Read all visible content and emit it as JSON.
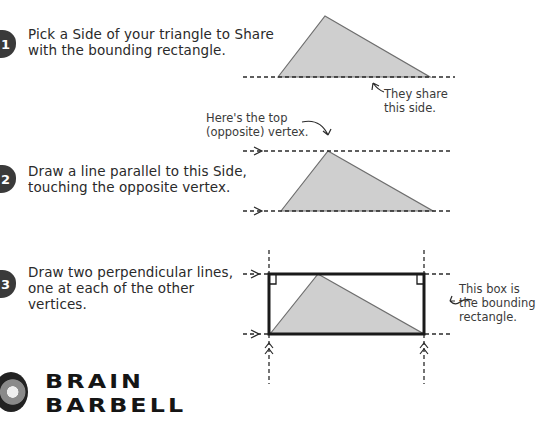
{
  "steps": [
    {
      "number": "1",
      "line1": "Pick a Side of your triangle to Share",
      "line2": "with the bounding rectangle.",
      "line3": ""
    },
    {
      "number": "2",
      "line1": "Draw a line parallel to this Side,",
      "line2": "touching the opposite vertex.",
      "line3": ""
    },
    {
      "number": "3",
      "line1": "Draw two perpendicular lines,",
      "line2": "one at each of the other",
      "line3": "vertices."
    }
  ],
  "annotations": {
    "shared_side": {
      "line1": "They share",
      "line2": "this side."
    },
    "top_vertex": {
      "line1": "Here's the top",
      "line2": "(opposite) vertex."
    },
    "bounding_box": {
      "line1": "This box is",
      "line2": "the bounding",
      "line3": "rectangle."
    }
  },
  "brand": {
    "line1": "BRAIN",
    "line2": "BARBELL",
    "icon": "barbell-icon"
  },
  "colors": {
    "triangle_fill": "#cfcfcf",
    "triangle_stroke": "#6e6e6e",
    "line": "#2a2a2a",
    "rectangle": "#1a1a1a",
    "badge": "#3a3a3a"
  }
}
